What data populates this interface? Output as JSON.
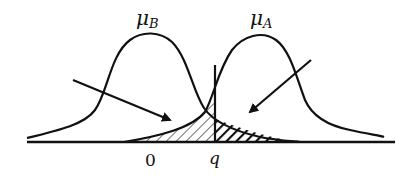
{
  "diagram": {
    "title": "",
    "distributions": [
      {
        "name": "mu_B",
        "symbol": "μ",
        "subscript": "B",
        "peak_x": 152
      },
      {
        "name": "mu_A",
        "symbol": "μ",
        "subscript": "A",
        "peak_x": 262
      }
    ],
    "axis": {
      "ticks": [
        {
          "label": "0"
        },
        {
          "label": "q"
        }
      ]
    },
    "regions": [
      {
        "name": "left-tail-of-A-below-q",
        "hatch": "light-diagonal"
      },
      {
        "name": "right-tail-of-B-above-q",
        "hatch": "dark-diagonal"
      }
    ],
    "arrows": [
      {
        "name": "arrow-to-left-hatched-region"
      },
      {
        "name": "arrow-to-right-hatched-region"
      }
    ],
    "colors": {
      "stroke": "#111111",
      "background": "#ffffff"
    }
  }
}
